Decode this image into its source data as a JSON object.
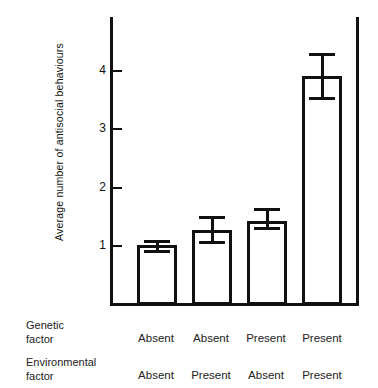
{
  "chart_data": {
    "type": "bar",
    "title": "",
    "xlabel": "",
    "ylabel": "Average number of  antisocial behaviours",
    "ylim": [
      0,
      4.9
    ],
    "yticks": [
      1,
      2,
      3,
      4
    ],
    "ytick_labels": [
      "1",
      "2",
      "3",
      "4"
    ],
    "grid": false,
    "legend": null,
    "categories": [
      "Absent / Absent",
      "Absent / Present",
      "Present / Absent",
      "Present / Present"
    ],
    "values": [
      1.0,
      1.25,
      1.4,
      3.88
    ],
    "error_upper": [
      1.08,
      1.49,
      1.62,
      4.28
    ],
    "error_lower": [
      0.85,
      1.0,
      1.24,
      3.47
    ],
    "bar_style": {
      "fill": "#ffffff",
      "edge": "#111111",
      "edge_width_px": 3
    },
    "group_factors": [
      {
        "name": "Genetic factor",
        "levels": [
          "Absent",
          "Absent",
          "Present",
          "Present"
        ]
      },
      {
        "name": "Environmental factor",
        "levels": [
          "Absent",
          "Present",
          "Absent",
          "Present"
        ]
      }
    ]
  },
  "axis": {
    "ytick_1": "1",
    "ytick_2": "2",
    "ytick_3": "3",
    "ytick_4": "4",
    "y_title": "Average number of  antisocial behaviours"
  },
  "factors": {
    "genetic": {
      "line1": "Genetic",
      "line2": "factor",
      "levels": [
        "Absent",
        "Absent",
        "Present",
        "Present"
      ]
    },
    "environmental": {
      "line1": "Environmental",
      "line2": "factor",
      "levels": [
        "Absent",
        "Present",
        "Absent",
        "Present"
      ]
    }
  },
  "colors": {
    "ink": "#111111",
    "background": "#ffffff"
  }
}
